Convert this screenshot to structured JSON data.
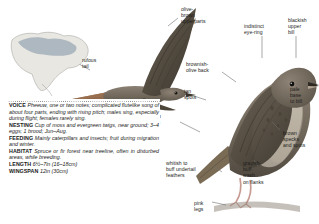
{
  "plate": {
    "species_illustrations": [
      "flying-bird-upperparts",
      "perched-bird-side"
    ],
    "range_map_label": "north-america-range-map"
  },
  "annotations": [
    {
      "id": "olive-brown-upperparts",
      "text": "olive-\nbrown\nupperparts"
    },
    {
      "id": "rufous-tail",
      "text": "rufous\ntail"
    },
    {
      "id": "indistinct-eye-ring",
      "text": "indistinct\neye-ring"
    },
    {
      "id": "blackish-upper-bill",
      "text": "blackish\nupper\nbill"
    },
    {
      "id": "brownish-olive-back",
      "text": "brownish-\nolive back"
    },
    {
      "id": "tan-spots",
      "text": "tan\nspots"
    },
    {
      "id": "pale-base-to-bill",
      "text": "pale\nbase\nto bill"
    },
    {
      "id": "olive-brown-wings",
      "text": "olive-\nbrown\nwings"
    },
    {
      "id": "brown-specks-and-spots",
      "text": "brown\nspecks\nand spots"
    },
    {
      "id": "whitish-to-buff-undertail-feathers",
      "text": "whitish to\nbuff undertail\nfeathers"
    },
    {
      "id": "grayish-buff-wash-on-flanks",
      "text": "grayish-\nbuff\nwash\non flanks"
    },
    {
      "id": "pink-legs",
      "text": "pink\nlegs"
    }
  ],
  "info_panel": {
    "rows": [
      {
        "tag": "VOICE",
        "value": "Pheeuw, one or two notes; complicated flutelike song of about four parts, ending with rising pitch; males sing, especially during flight; females rarely sing."
      },
      {
        "tag": "NESTING",
        "value": "Cup of moss and evergreen twigs, near ground; 3–4 eggs; 1 brood; Jun–Aug."
      },
      {
        "tag": "FEEDING",
        "value": "Mainly caterpillars and insects; fruit during migration and winter."
      },
      {
        "tag": "HABITAT",
        "value": "Spruce or fir forest near treeline, often in disturbed areas, while breeding."
      }
    ],
    "measurements": [
      {
        "tag": "LENGTH",
        "value": "6½–7in (16–18cm)"
      },
      {
        "tag": "WINGSPAN",
        "value": "12in (30cm)"
      }
    ]
  },
  "colors": {
    "text": "#1d1d1b",
    "leader_line": "#6e6e6e",
    "bird_body": "#7d7366",
    "bird_dark": "#4a4339",
    "rufous_tail": "#8a6242",
    "map_range": "#9aa8b4",
    "panel_bg": "#ffffff"
  }
}
